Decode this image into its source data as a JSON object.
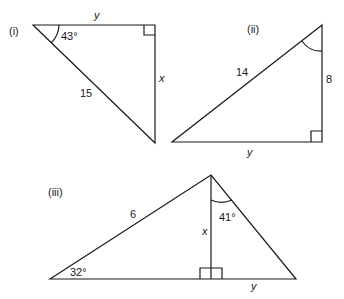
{
  "diagram": {
    "triangles": [
      {
        "id": "i",
        "label": "(i)",
        "angle": "43°",
        "sides": {
          "top": "y",
          "right": "x",
          "hypotenuse": "15"
        }
      },
      {
        "id": "ii",
        "label": "(ii)",
        "angle": "",
        "sides": {
          "hypotenuse": "14",
          "right": "8",
          "bottom": "y"
        }
      },
      {
        "id": "iii",
        "label": "(iii)",
        "angles": {
          "left": "32°",
          "apex": "41°"
        },
        "sides": {
          "left": "6",
          "altitude": "x",
          "base_right": "y"
        }
      }
    ]
  }
}
